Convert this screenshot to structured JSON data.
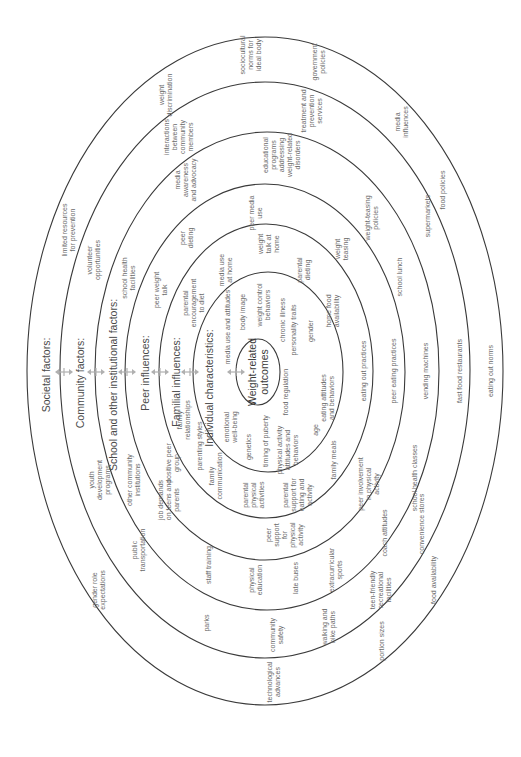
{
  "diagram": {
    "rings": [
      {
        "id": "societal",
        "cx": 265,
        "cy": 371,
        "rx": 238,
        "ry": 334
      },
      {
        "id": "community",
        "cx": 265,
        "cy": 370,
        "rx": 205,
        "ry": 288
      },
      {
        "id": "school",
        "cx": 267,
        "cy": 371,
        "rx": 172,
        "ry": 239
      },
      {
        "id": "peer",
        "cx": 265,
        "cy": 372,
        "rx": 140,
        "ry": 188
      },
      {
        "id": "familial",
        "cx": 266,
        "cy": 371,
        "rx": 107,
        "ry": 147
      },
      {
        "id": "individual",
        "cx": 268,
        "cy": 372,
        "rx": 75,
        "ry": 100
      },
      {
        "id": "outcomes",
        "cx": 258,
        "cy": 372,
        "rx": 22,
        "ry": 33
      }
    ],
    "level_titles": [
      {
        "text": "Societal factors:",
        "x": 46,
        "y": 375
      },
      {
        "text": "Community factors:",
        "x": 80,
        "y": 383
      },
      {
        "text": "School and other institutional factors:",
        "x": 113,
        "y": 385
      },
      {
        "text": "Peer influences:",
        "x": 145,
        "y": 373
      },
      {
        "text": "Familial influences:",
        "x": 176,
        "y": 382
      },
      {
        "text": "Individual characteristics:",
        "x": 209,
        "y": 388
      }
    ],
    "center": {
      "lines": [
        "Weight-related",
        "outcomes"
      ],
      "x": 258,
      "y": 372
    },
    "arrows": [
      {
        "x": 64,
        "y": 372
      },
      {
        "x": 96,
        "y": 372
      },
      {
        "x": 127,
        "y": 372
      },
      {
        "x": 160,
        "y": 372
      },
      {
        "x": 190,
        "y": 372
      },
      {
        "x": 236,
        "y": 372
      }
    ],
    "factors": {
      "societal": [
        {
          "lines": [
            "sociocultural",
            "norms for",
            "ideal body"
          ],
          "x": 250,
          "y": 55
        },
        {
          "lines": [
            "government",
            "policies"
          ],
          "x": 318,
          "y": 62
        },
        {
          "lines": [
            "weight",
            "discrimination"
          ],
          "x": 165,
          "y": 95
        },
        {
          "lines": [
            "limited resources",
            "for prevention"
          ],
          "x": 68,
          "y": 230
        },
        {
          "lines": [
            "media",
            "influences"
          ],
          "x": 401,
          "y": 122
        },
        {
          "lines": [
            "food policies"
          ],
          "x": 442,
          "y": 190
        },
        {
          "lines": [
            "eating out norms"
          ],
          "x": 490,
          "y": 371
        },
        {
          "lines": [
            "food availability"
          ],
          "x": 433,
          "y": 580
        },
        {
          "lines": [
            "portion sizes"
          ],
          "x": 381,
          "y": 641
        },
        {
          "lines": [
            "technological",
            "advances"
          ],
          "x": 273,
          "y": 682
        },
        {
          "lines": [
            "gender role",
            "expectations"
          ],
          "x": 98,
          "y": 590
        }
      ],
      "community": [
        {
          "lines": [
            "interactions",
            "between",
            "community",
            "members"
          ],
          "x": 178,
          "y": 137
        },
        {
          "lines": [
            "treatment and",
            "prevention",
            "services"
          ],
          "x": 311,
          "y": 111
        },
        {
          "lines": [
            "volunteer",
            "opportunities"
          ],
          "x": 93,
          "y": 260
        },
        {
          "lines": [
            "supermarkets"
          ],
          "x": 427,
          "y": 216
        },
        {
          "lines": [
            "fast food restaurants"
          ],
          "x": 459,
          "y": 371
        },
        {
          "lines": [
            "convenience stores"
          ],
          "x": 421,
          "y": 524
        },
        {
          "lines": [
            "teen-friendly",
            "recreational",
            "facilities"
          ],
          "x": 380,
          "y": 590
        },
        {
          "lines": [
            "walking and",
            "bike paths"
          ],
          "x": 328,
          "y": 627
        },
        {
          "lines": [
            "community",
            "safety"
          ],
          "x": 276,
          "y": 635
        },
        {
          "lines": [
            "parks"
          ],
          "x": 206,
          "y": 623
        },
        {
          "lines": [
            "public",
            "transportation"
          ],
          "x": 138,
          "y": 550
        },
        {
          "lines": [
            "youth",
            "development",
            "programs"
          ],
          "x": 99,
          "y": 480
        }
      ],
      "school": [
        {
          "lines": [
            "media",
            "awareness",
            "and advocacy"
          ],
          "x": 185,
          "y": 180
        },
        {
          "lines": [
            "educational",
            "programs",
            "addressing",
            "weight-related",
            "disorders"
          ],
          "x": 281,
          "y": 155
        },
        {
          "lines": [
            "school health",
            "facilities"
          ],
          "x": 128,
          "y": 278
        },
        {
          "lines": [
            "weight-teasing",
            "policies"
          ],
          "x": 371,
          "y": 218
        },
        {
          "lines": [
            "school lunch"
          ],
          "x": 399,
          "y": 277
        },
        {
          "lines": [
            "vending machines"
          ],
          "x": 425,
          "y": 371
        },
        {
          "lines": [
            "school health classes"
          ],
          "x": 414,
          "y": 478
        },
        {
          "lines": [
            "coach attitudes"
          ],
          "x": 384,
          "y": 533
        },
        {
          "lines": [
            "extracurricular",
            "sports"
          ],
          "x": 335,
          "y": 570
        },
        {
          "lines": [
            "late buses"
          ],
          "x": 295,
          "y": 578
        },
        {
          "lines": [
            "physical",
            "education"
          ],
          "x": 255,
          "y": 580
        },
        {
          "lines": [
            "staff training"
          ],
          "x": 208,
          "y": 565
        },
        {
          "lines": [
            "job demands",
            "on teens and",
            "parents"
          ],
          "x": 168,
          "y": 500
        },
        {
          "lines": [
            "other community",
            "institutions"
          ],
          "x": 133,
          "y": 480
        }
      ],
      "peer": [
        {
          "lines": [
            "peer",
            "dieting"
          ],
          "x": 186,
          "y": 238
        },
        {
          "lines": [
            "peer media",
            "use"
          ],
          "x": 255,
          "y": 213
        },
        {
          "lines": [
            "peer weight",
            "talk"
          ],
          "x": 160,
          "y": 290
        },
        {
          "lines": [
            "weight",
            "teasing"
          ],
          "x": 341,
          "y": 249
        },
        {
          "lines": [
            "peer eating practices"
          ],
          "x": 393,
          "y": 371
        },
        {
          "lines": [
            "peer involvement",
            "in physical",
            "activity"
          ],
          "x": 368,
          "y": 484
        },
        {
          "lines": [
            "peer",
            "support",
            "for",
            "physical",
            "activity"
          ],
          "x": 284,
          "y": 535
        },
        {
          "lines": [
            "positive peer",
            "group"
          ],
          "x": 172,
          "y": 463
        }
      ],
      "familial": [
        {
          "lines": [
            "media use",
            "at home"
          ],
          "x": 225,
          "y": 270
        },
        {
          "lines": [
            "weight",
            "talk at",
            "home"
          ],
          "x": 268,
          "y": 244
        },
        {
          "lines": [
            "parental",
            "encouragement",
            "to diet"
          ],
          "x": 193,
          "y": 303
        },
        {
          "lines": [
            "parental",
            "dieting"
          ],
          "x": 303,
          "y": 270
        },
        {
          "lines": [
            "home food",
            "availability"
          ],
          "x": 332,
          "y": 311
        },
        {
          "lines": [
            "eating out practices"
          ],
          "x": 363,
          "y": 371
        },
        {
          "lines": [
            "family meals"
          ],
          "x": 333,
          "y": 460
        },
        {
          "lines": [
            "parental",
            "support for",
            "eating and",
            "activity"
          ],
          "x": 297,
          "y": 495
        },
        {
          "lines": [
            "parental",
            "physical",
            "activities"
          ],
          "x": 253,
          "y": 495
        },
        {
          "lines": [
            "family",
            "communication"
          ],
          "x": 215,
          "y": 476
        },
        {
          "lines": [
            "parenting styles"
          ],
          "x": 199,
          "y": 446
        },
        {
          "lines": [
            "family",
            "relationships"
          ],
          "x": 183,
          "y": 420
        }
      ],
      "individual": [
        {
          "lines": [
            "media use and attitudes"
          ],
          "x": 227,
          "y": 327
        },
        {
          "lines": [
            "body image"
          ],
          "x": 242,
          "y": 312
        },
        {
          "lines": [
            "weight control",
            "behaviors"
          ],
          "x": 263,
          "y": 305
        },
        {
          "lines": [
            "chronic illness"
          ],
          "x": 282,
          "y": 320
        },
        {
          "lines": [
            "personality traits"
          ],
          "x": 293,
          "y": 330
        },
        {
          "lines": [
            "gender"
          ],
          "x": 310,
          "y": 331
        },
        {
          "lines": [
            "food regulation"
          ],
          "x": 285,
          "y": 392
        },
        {
          "lines": [
            "eating attitudes",
            "and behaviors"
          ],
          "x": 327,
          "y": 398
        },
        {
          "lines": [
            "age"
          ],
          "x": 315,
          "y": 430
        },
        {
          "lines": [
            "physical activity",
            "attitudes and",
            "behaviors"
          ],
          "x": 287,
          "y": 450
        },
        {
          "lines": [
            "timing of puberty"
          ],
          "x": 265,
          "y": 441
        },
        {
          "lines": [
            "genetics"
          ],
          "x": 248,
          "y": 447
        },
        {
          "lines": [
            "emotional",
            "well-being"
          ],
          "x": 230,
          "y": 427
        }
      ]
    }
  }
}
